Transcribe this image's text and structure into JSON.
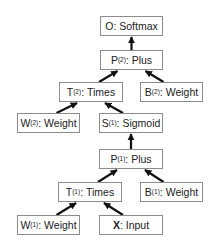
{
  "diagram": {
    "type": "computation-graph",
    "nodes": [
      {
        "id": "O",
        "sym": "O",
        "sup": "",
        "op": "Softmax",
        "x": 100,
        "y": 16,
        "w": 63
      },
      {
        "id": "P2",
        "sym": "P",
        "sup": "(2)",
        "op": "Plus",
        "x": 100,
        "y": 50,
        "w": 63
      },
      {
        "id": "T2",
        "sym": "T",
        "sup": "(2)",
        "op": "Times",
        "x": 59,
        "y": 82,
        "w": 64
      },
      {
        "id": "B2",
        "sym": "B",
        "sup": "(2)",
        "op": "Weight",
        "x": 140,
        "y": 82,
        "w": 63
      },
      {
        "id": "W2",
        "sym": "W",
        "sup": "(2)",
        "op": "Weight",
        "x": 17,
        "y": 113,
        "w": 63
      },
      {
        "id": "S1",
        "sym": "S",
        "sup": "(1)",
        "op": "Sigmoid",
        "x": 99,
        "y": 113,
        "w": 64
      },
      {
        "id": "P1",
        "sym": "P",
        "sup": "(1)",
        "op": "Plus",
        "x": 99,
        "y": 149,
        "w": 64
      },
      {
        "id": "T1",
        "sym": "T",
        "sup": "(1)",
        "op": "Times",
        "x": 58,
        "y": 182,
        "w": 64
      },
      {
        "id": "B1",
        "sym": "B",
        "sup": "(1)",
        "op": "Weight",
        "x": 140,
        "y": 182,
        "w": 63
      },
      {
        "id": "W1",
        "sym": "W",
        "sup": "(1)",
        "op": "Weight",
        "x": 17,
        "y": 215,
        "w": 63
      },
      {
        "id": "X",
        "sym": "X",
        "sup": "",
        "op": "Input",
        "x": 99,
        "y": 215,
        "w": 64,
        "bold": true
      }
    ],
    "edges": [
      {
        "from": "P2",
        "to": "O"
      },
      {
        "from": "T2",
        "to": "P2"
      },
      {
        "from": "B2",
        "to": "P2"
      },
      {
        "from": "W2",
        "to": "T2"
      },
      {
        "from": "S1",
        "to": "T2"
      },
      {
        "from": "P1",
        "to": "S1"
      },
      {
        "from": "T1",
        "to": "P1"
      },
      {
        "from": "B1",
        "to": "P1"
      },
      {
        "from": "W1",
        "to": "T1"
      },
      {
        "from": "X",
        "to": "T1"
      }
    ],
    "colors": {
      "border": "#8c8c8c",
      "arrow": "#111111",
      "text": "#222222"
    }
  }
}
